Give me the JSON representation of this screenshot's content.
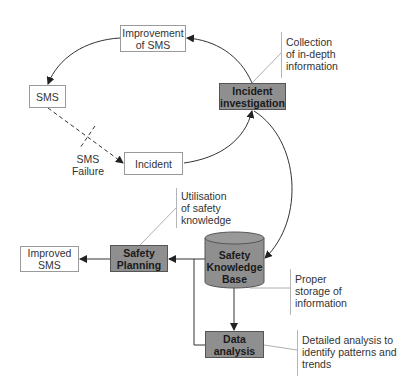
{
  "diagram": {
    "type": "process cycle diagram",
    "nodes": {
      "improvement_of_sms": {
        "label": "Improvement of SMS",
        "line1": "Improvement",
        "line2": "of SMS",
        "style": "white"
      },
      "sms": {
        "label": "SMS",
        "style": "white"
      },
      "incident": {
        "label": "Incident",
        "style": "white"
      },
      "incident_investigation": {
        "label": "Incident investigation",
        "line1": "Incident",
        "line2": "investigation",
        "style": "gray"
      },
      "safety_knowledge_base": {
        "label": "Safety Knowledge Base",
        "line1": "Safety",
        "line2": "Knowledge",
        "line3": "Base",
        "style": "gray-cylinder"
      },
      "safety_planning": {
        "label": "Safety Planning",
        "line1": "Safety",
        "line2": "Planning",
        "style": "gray"
      },
      "improved_sms": {
        "label": "Improved SMS",
        "line1": "Improved",
        "line2": "SMS",
        "style": "white"
      },
      "data_analysis": {
        "label": "Data analysis",
        "line1": "Data",
        "line2": "analysis",
        "style": "gray"
      }
    },
    "edge_labels": {
      "sms_failure": {
        "line1": "SMS",
        "line2": "Failure"
      }
    },
    "annotations": {
      "collection": {
        "line1": "Collection",
        "line2": "of in-depth",
        "line3": "information"
      },
      "utilisation": {
        "line1": "Utilisation",
        "line2": "of safety",
        "line3": "knowledge"
      },
      "storage": {
        "line1": "Proper",
        "line2": "storage of",
        "line3": "information"
      },
      "analysis": {
        "line1": "Detailed analysis to",
        "line2": "identify patterns and",
        "line3": "trends"
      }
    },
    "edges": [
      {
        "from": "Incident investigation",
        "to": "Improvement of SMS",
        "style": "solid curve"
      },
      {
        "from": "Improvement of SMS",
        "to": "SMS",
        "style": "solid curve"
      },
      {
        "from": "SMS",
        "to": "Incident",
        "style": "dashed",
        "label": "SMS Failure"
      },
      {
        "from": "Incident",
        "to": "Incident investigation",
        "style": "solid curve"
      },
      {
        "from": "Incident investigation",
        "to": "Safety Knowledge Base",
        "style": "solid curve, bidirectional"
      },
      {
        "from": "Safety Knowledge Base",
        "to": "Safety Planning",
        "style": "solid"
      },
      {
        "from": "Safety Planning",
        "to": "Improved SMS",
        "style": "solid"
      },
      {
        "from": "Safety Knowledge Base",
        "to": "Data analysis",
        "style": "solid"
      },
      {
        "from": "Data analysis",
        "to": "Safety Planning",
        "style": "solid elbow"
      }
    ],
    "colors": {
      "gray_fill": "#8f8f8f",
      "line": "#333333",
      "border_light": "#9a9a9a"
    }
  }
}
